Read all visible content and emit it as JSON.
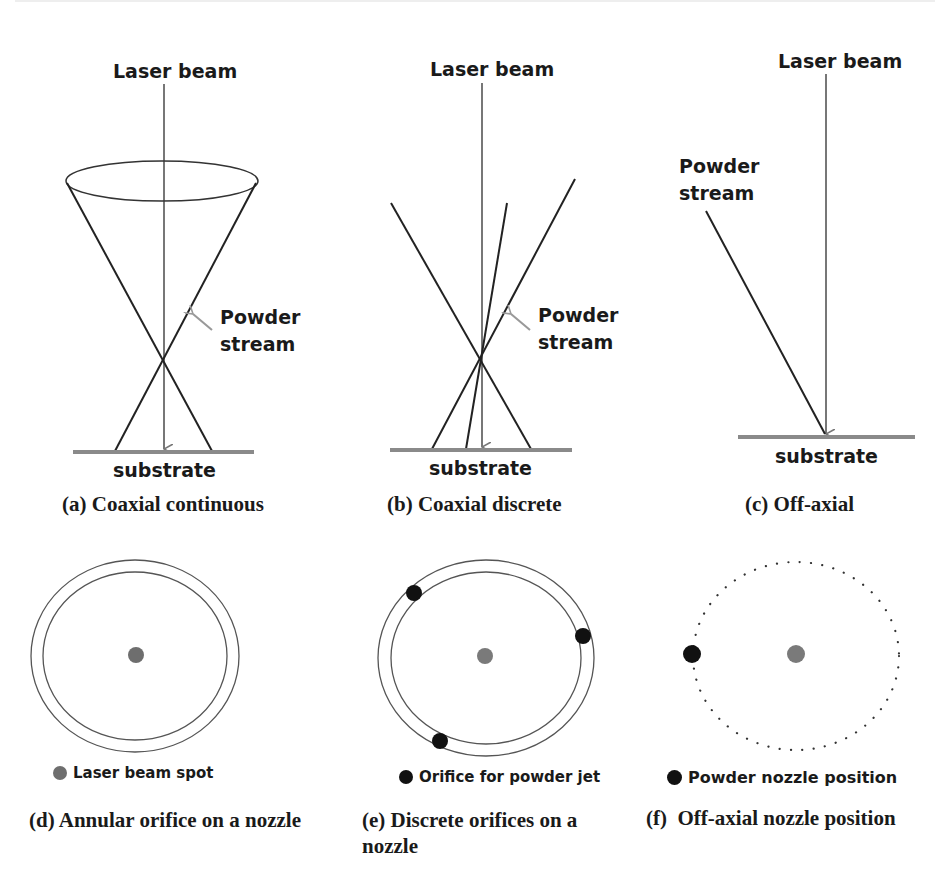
{
  "colors": {
    "line": "#222222",
    "beam": "#777777",
    "substrate": "#8a8a8a",
    "laser_spot": "#7a7a7a",
    "orifice": "#111111",
    "arrow": "#999999"
  },
  "panels": {
    "a": {
      "laser_label": "Laser beam",
      "powder_label_line1": "Powder",
      "powder_label_line2": "stream",
      "substrate_label": "substrate",
      "caption": "(a) Coaxial continuous"
    },
    "b": {
      "laser_label": "Laser beam",
      "powder_label_line1": "Powder",
      "powder_label_line2": "stream",
      "substrate_label": "substrate",
      "caption": "(b) Coaxial discrete"
    },
    "c": {
      "laser_label": "Laser beam",
      "powder_label_line1": "Powder",
      "powder_label_line2": "stream",
      "substrate_label": "substrate",
      "caption": "(c) Off-axial"
    },
    "d": {
      "legend": "Laser beam spot",
      "caption": "(d) Annular orifice on a nozzle"
    },
    "e": {
      "legend": "Orifice for powder jet",
      "caption_line1": "(e) Discrete orifices on a",
      "caption_line2": "nozzle"
    },
    "f": {
      "legend": "Powder nozzle position",
      "caption": "(f)  Off-axial nozzle position"
    }
  }
}
